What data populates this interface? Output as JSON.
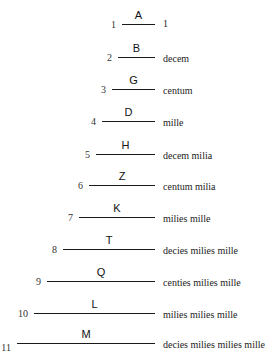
{
  "diagram": {
    "line_right": 155,
    "rows": [
      {
        "index": "1",
        "letter": "A",
        "name": "1",
        "y": 24,
        "left": 122
      },
      {
        "index": "2",
        "letter": "B",
        "name": "decem",
        "y": 57,
        "left": 118
      },
      {
        "index": "3",
        "letter": "G",
        "name": "centum",
        "y": 89,
        "left": 112
      },
      {
        "index": "4",
        "letter": "D",
        "name": "mille",
        "y": 121,
        "left": 102
      },
      {
        "index": "5",
        "letter": "H",
        "name": "decem milia",
        "y": 154,
        "left": 96
      },
      {
        "index": "6",
        "letter": "Z",
        "name": "centum milia",
        "y": 185,
        "left": 89
      },
      {
        "index": "7",
        "letter": "K",
        "name": "milies mille",
        "y": 217,
        "left": 79
      },
      {
        "index": "8",
        "letter": "T",
        "name": "decies milies mille",
        "y": 249,
        "left": 63
      },
      {
        "index": "9",
        "letter": "Q",
        "name": "centies milies mille",
        "y": 281,
        "left": 47
      },
      {
        "index": "10",
        "letter": "L",
        "name": "milies milies mille",
        "y": 313,
        "left": 34
      },
      {
        "index": "11",
        "letter": "M",
        "name": "decies milies milies mille",
        "y": 343,
        "left": 17
      }
    ]
  }
}
